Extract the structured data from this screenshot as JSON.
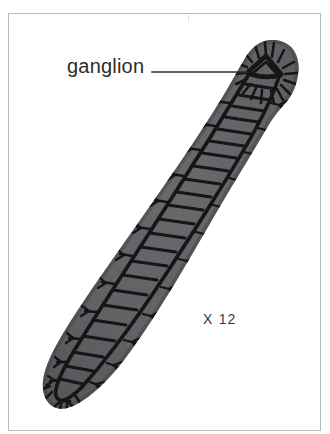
{
  "figure": {
    "kind": "scanned-biology-illustration",
    "background_color": "#ffffff",
    "frame_color": "#b9babc",
    "body_fill_color": "#5f6063",
    "body_shadow_color": "#4a4b4e",
    "nerve_color": "#131315",
    "ink_color": "#2c2c2e"
  },
  "labels": {
    "ganglion": "ganglion",
    "magnification": "X 12"
  },
  "annotations": {
    "leader_line": {
      "from_x": 152,
      "from_y": 72,
      "to_x": 247,
      "to_y": 72
    }
  },
  "anatomy": {
    "parts": [
      "anterior ganglion",
      "ventral nerve cords",
      "transverse commissures",
      "lateral nerve branches",
      "auricular sensory fibers"
    ],
    "commissure_count": 21
  }
}
